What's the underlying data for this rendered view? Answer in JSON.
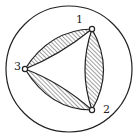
{
  "diagram": {
    "type": "graph-in-circle",
    "outer_circle": {
      "cx": 69,
      "cy": 69,
      "r": 63
    },
    "colors": {
      "stroke": "#222222",
      "hatch": "#444444",
      "background": "#ffffff",
      "vertex_fill": "#ffffff"
    },
    "vertices": [
      {
        "id": "1",
        "label": "1",
        "x": 92,
        "y": 29,
        "label_x": 76,
        "label_y": 23
      },
      {
        "id": "2",
        "label": "2",
        "x": 92,
        "y": 110,
        "label_x": 103,
        "label_y": 113
      },
      {
        "id": "3",
        "label": "3",
        "x": 25,
        "y": 69,
        "label_x": 14,
        "label_y": 70
      }
    ],
    "edges": [
      {
        "from": "1",
        "to": "3",
        "shape": "hatched-lens"
      },
      {
        "from": "1",
        "to": "2",
        "shape": "hatched-lens"
      },
      {
        "from": "2",
        "to": "3",
        "shape": "hatched-lens"
      }
    ]
  }
}
